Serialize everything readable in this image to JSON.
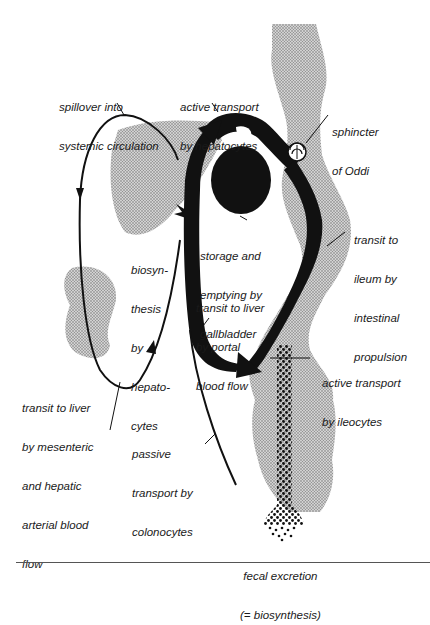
{
  "figure": {
    "colors": {
      "ink": "#111111",
      "stipple": "#bdbdbd",
      "background": "#ffffff"
    },
    "labels": {
      "spillover": [
        "spillover into",
        "systemic circulation"
      ],
      "active_hepatocytes": [
        "active transport",
        "by hepatocytes"
      ],
      "sphincter": [
        "sphincter",
        "of Oddi"
      ],
      "biosynthesis": [
        "biosyn-",
        "thesis",
        "by",
        "hepato-",
        "cytes"
      ],
      "gallbladder": [
        "storage and",
        "emptying by",
        "gallbladder"
      ],
      "transit_ileum": [
        "transit to",
        "ileum by",
        "intestinal",
        "propulsion"
      ],
      "portal_flow": [
        "transit to liver",
        "by portal",
        "blood flow"
      ],
      "active_ileocytes": [
        "active transport",
        "by ileocytes"
      ],
      "mesenteric": [
        "transit to liver",
        "by mesenteric",
        "and hepatic",
        "arterial blood",
        "flow"
      ],
      "passive_colonocytes": [
        "passive",
        "transport by",
        "colonocytes"
      ],
      "fecal": [
        "fecal excretion",
        "(= biosynthesis)"
      ]
    }
  }
}
